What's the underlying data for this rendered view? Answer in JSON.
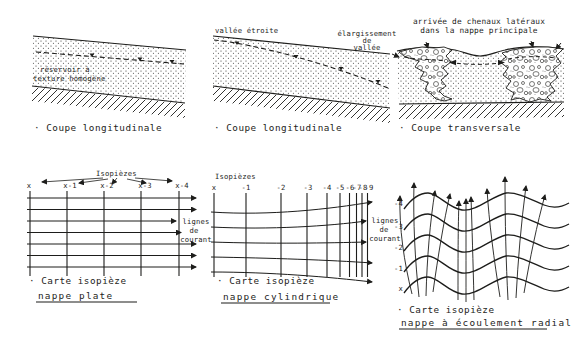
{
  "figure": {
    "top_left": {
      "reservoir_line1": "réservoir à",
      "reservoir_line2": "texture homogène",
      "caption": "· Coupe longitudinale"
    },
    "top_middle": {
      "valley_label": "vallée étroite",
      "widening_line1": "élargissement",
      "widening_line2": "de",
      "widening_line3": "vallée",
      "caption": "· Coupe longitudinale"
    },
    "top_right": {
      "channels_line1": "arrivée de chenaux latéraux",
      "channels_line2": "dans la nappe principale",
      "caption": "· Coupe transversale"
    },
    "bottom_left": {
      "isopiezes_label": "Isopièzes",
      "columns": [
        "x",
        "x-1",
        "x-2",
        "x-3",
        "x-4"
      ],
      "flowlines_line1": "lignes",
      "flowlines_line2": "de",
      "flowlines_line3": "courant",
      "caption": "· Carte isopièze",
      "subcaption": "nappe plate"
    },
    "bottom_middle": {
      "isopiezes_label": "Isopièzes",
      "columns": [
        "x",
        "-1",
        "-2",
        "-3",
        "-4",
        "-5",
        "-6",
        "-7",
        "-8",
        "-9"
      ],
      "flowlines_line1": "lignes",
      "flowlines_line2": "de",
      "flowlines_line3": "courant",
      "caption": "· Carte isopièze",
      "subcaption": "nappe cylindrique"
    },
    "bottom_right": {
      "rows": [
        "-4",
        "-3",
        "-2",
        "-1",
        "x"
      ],
      "caption": "· Carte isopièze",
      "subcaption": "nappe à écoulement radial"
    }
  },
  "colors": {
    "ink": "#1d1d1b",
    "paper": "#ffffff"
  }
}
